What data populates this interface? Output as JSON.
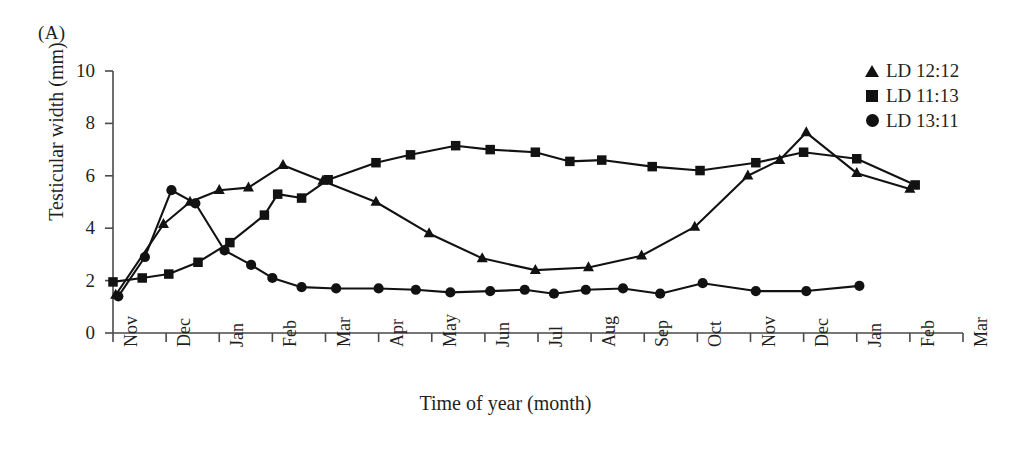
{
  "panel": {
    "label": "(A)"
  },
  "chart_data": {
    "type": "line",
    "title": "",
    "xlabel": "Time of year (month)",
    "ylabel": "Testicular width (mm)",
    "ylim": [
      0,
      10
    ],
    "yticks": [
      0,
      2,
      4,
      6,
      8,
      10
    ],
    "grid": false,
    "legend_position": "top-right",
    "categories": [
      "Nov",
      "Dec",
      "Jan",
      "Feb",
      "Mar",
      "Apr",
      "May",
      "Jun",
      "Jul",
      "Aug",
      "Sep",
      "Oct",
      "Nov",
      "Dec",
      "Jan",
      "Feb",
      "Mar"
    ],
    "x_axis_note": "Data sampled at roughly half-month intervals; x given in month index where 0 = Nov (first).",
    "series": [
      {
        "name": "LD 12:12",
        "marker": "triangle",
        "points": [
          {
            "x": 0.05,
            "y": 1.45
          },
          {
            "x": 0.95,
            "y": 4.15
          },
          {
            "x": 1.45,
            "y": 5.0
          },
          {
            "x": 2.0,
            "y": 5.45
          },
          {
            "x": 2.55,
            "y": 5.55
          },
          {
            "x": 3.2,
            "y": 6.4
          },
          {
            "x": 3.95,
            "y": 5.8
          },
          {
            "x": 4.95,
            "y": 5.0
          },
          {
            "x": 5.95,
            "y": 3.8
          },
          {
            "x": 6.95,
            "y": 2.85
          },
          {
            "x": 7.95,
            "y": 2.4
          },
          {
            "x": 8.95,
            "y": 2.5
          },
          {
            "x": 9.95,
            "y": 2.95
          },
          {
            "x": 10.95,
            "y": 4.05
          },
          {
            "x": 11.95,
            "y": 6.0
          },
          {
            "x": 12.55,
            "y": 6.6
          },
          {
            "x": 13.05,
            "y": 7.65
          },
          {
            "x": 14.0,
            "y": 6.1
          },
          {
            "x": 15.0,
            "y": 5.5
          }
        ]
      },
      {
        "name": "LD 11:13",
        "marker": "square",
        "points": [
          {
            "x": 0.0,
            "y": 1.95
          },
          {
            "x": 0.55,
            "y": 2.1
          },
          {
            "x": 1.05,
            "y": 2.25
          },
          {
            "x": 1.6,
            "y": 2.7
          },
          {
            "x": 2.2,
            "y": 3.45
          },
          {
            "x": 2.85,
            "y": 4.5
          },
          {
            "x": 3.1,
            "y": 5.3
          },
          {
            "x": 3.55,
            "y": 5.15
          },
          {
            "x": 4.05,
            "y": 5.85
          },
          {
            "x": 4.95,
            "y": 6.5
          },
          {
            "x": 5.6,
            "y": 6.8
          },
          {
            "x": 6.45,
            "y": 7.15
          },
          {
            "x": 7.1,
            "y": 7.0
          },
          {
            "x": 7.95,
            "y": 6.9
          },
          {
            "x": 8.6,
            "y": 6.55
          },
          {
            "x": 9.2,
            "y": 6.6
          },
          {
            "x": 10.15,
            "y": 6.35
          },
          {
            "x": 11.05,
            "y": 6.2
          },
          {
            "x": 12.1,
            "y": 6.5
          },
          {
            "x": 13.0,
            "y": 6.9
          },
          {
            "x": 14.0,
            "y": 6.65
          },
          {
            "x": 15.1,
            "y": 5.65
          }
        ]
      },
      {
        "name": "LD 13:11",
        "marker": "circle",
        "points": [
          {
            "x": 0.1,
            "y": 1.4
          },
          {
            "x": 0.6,
            "y": 2.9
          },
          {
            "x": 1.1,
            "y": 5.45
          },
          {
            "x": 1.55,
            "y": 4.95
          },
          {
            "x": 2.1,
            "y": 3.15
          },
          {
            "x": 2.6,
            "y": 2.6
          },
          {
            "x": 3.0,
            "y": 2.1
          },
          {
            "x": 3.55,
            "y": 1.75
          },
          {
            "x": 4.2,
            "y": 1.7
          },
          {
            "x": 5.0,
            "y": 1.7
          },
          {
            "x": 5.7,
            "y": 1.65
          },
          {
            "x": 6.35,
            "y": 1.55
          },
          {
            "x": 7.1,
            "y": 1.6
          },
          {
            "x": 7.75,
            "y": 1.65
          },
          {
            "x": 8.3,
            "y": 1.5
          },
          {
            "x": 8.9,
            "y": 1.65
          },
          {
            "x": 9.6,
            "y": 1.7
          },
          {
            "x": 10.3,
            "y": 1.5
          },
          {
            "x": 11.1,
            "y": 1.9
          },
          {
            "x": 12.1,
            "y": 1.6
          },
          {
            "x": 13.05,
            "y": 1.6
          },
          {
            "x": 14.05,
            "y": 1.8
          }
        ]
      }
    ]
  },
  "legend": {
    "items": [
      {
        "label": "LD 12:12",
        "marker": "triangle"
      },
      {
        "label": "LD 11:13",
        "marker": "square"
      },
      {
        "label": "LD 13:11",
        "marker": "circle"
      }
    ]
  }
}
